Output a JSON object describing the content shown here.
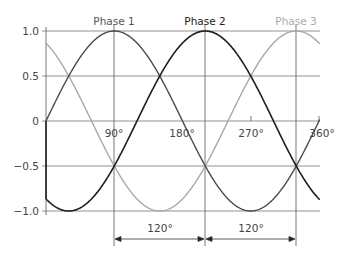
{
  "chart_data": {
    "type": "line",
    "title": "",
    "xlabel": "",
    "ylabel": "",
    "x_unit": "degrees",
    "xlim": [
      0,
      361
    ],
    "ylim": [
      -1.0,
      1.0
    ],
    "x_ticks": [
      {
        "value": 90,
        "label": "90°"
      },
      {
        "value": 180,
        "label": "180°"
      },
      {
        "value": 270,
        "label": "270°"
      },
      {
        "value": 360,
        "label": "360°"
      }
    ],
    "y_ticks": [
      {
        "value": 1.0,
        "label": "1.0"
      },
      {
        "value": 0.5,
        "label": "0.5"
      },
      {
        "value": 0,
        "label": "0"
      },
      {
        "value": -0.5,
        "label": "-0.5"
      },
      {
        "value": -1.0,
        "label": "-1.0"
      }
    ],
    "grid": true,
    "series": [
      {
        "name": "Phase 1",
        "function": "sin(x)",
        "phase_shift_deg": 0,
        "color": "#4a4a4a",
        "peak_x": 90,
        "x": [
          0,
          30,
          60,
          90,
          120,
          150,
          180,
          210,
          240,
          270,
          300,
          330,
          360
        ],
        "values": [
          0,
          0.5,
          0.866,
          1.0,
          0.866,
          0.5,
          0,
          -0.5,
          -0.866,
          -1.0,
          -0.866,
          -0.5,
          0
        ]
      },
      {
        "name": "Phase 2",
        "function": "sin(x-120)",
        "phase_shift_deg": 120,
        "color": "#1e1e1e",
        "peak_x": 210,
        "x": [
          0,
          30,
          60,
          90,
          120,
          150,
          180,
          210,
          240,
          270,
          300,
          330,
          360
        ],
        "values": [
          -0.866,
          -1.0,
          -0.866,
          -0.5,
          0,
          0.5,
          0.866,
          1.0,
          0.866,
          0.5,
          0,
          -0.5,
          -0.866
        ]
      },
      {
        "name": "Phase 3",
        "function": "sin(x-240)",
        "phase_shift_deg": 240,
        "color": "#a8a8a8",
        "peak_x": 330,
        "x": [
          0,
          30,
          60,
          90,
          120,
          150,
          180,
          210,
          240,
          270,
          300,
          330,
          360
        ],
        "values": [
          0.866,
          0.5,
          0,
          -0.5,
          -0.866,
          -1.0,
          -0.866,
          -0.5,
          0,
          0.5,
          0.866,
          1.0,
          0.866
        ]
      }
    ],
    "vertical_markers_deg": [
      90,
      210,
      330
    ],
    "annotations": [
      {
        "type": "dimension",
        "from": 90,
        "to": 210,
        "label": "120°"
      },
      {
        "type": "dimension",
        "from": 210,
        "to": 330,
        "label": "120°"
      }
    ],
    "legend_position": "series labels above each peak"
  },
  "labels": {
    "phase1": "Phase 1",
    "phase2": "Phase 2",
    "phase3": "Phase 3",
    "y_1": "1.0",
    "y_05": "0.5",
    "y_0": "0",
    "y_m05": "−0.5",
    "y_m1": "−1.0",
    "x_90": "90°",
    "x_180": "180°",
    "x_270": "270°",
    "x_360": "360°",
    "dim1": "120°",
    "dim2": "120°"
  }
}
